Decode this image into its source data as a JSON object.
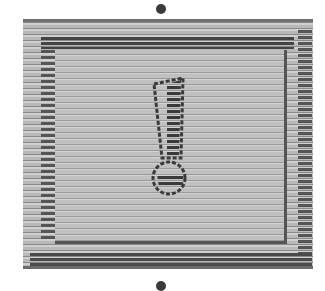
{
  "icon": {
    "name": "exclamation-warning",
    "style": "grayscale scanline"
  },
  "colors": {
    "background": "#ffffff",
    "panel": "#c4c4c4",
    "stroke": "#3a3a3a"
  }
}
